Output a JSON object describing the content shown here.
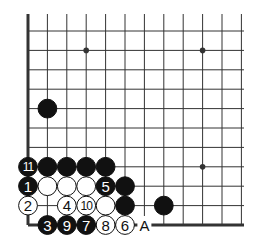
{
  "diagram": {
    "type": "go-board-corner",
    "grid": {
      "cols": 12,
      "rows": 11,
      "origin_x": 28,
      "origin_y": 225,
      "spacing": 19.4,
      "edge_left": true,
      "edge_bottom": true
    },
    "star_points": [
      [
        3,
        9
      ],
      [
        9,
        9
      ],
      [
        9,
        3
      ]
    ],
    "stones": [
      {
        "col": 1,
        "row": 0,
        "color": "black",
        "label": "3"
      },
      {
        "col": 2,
        "row": 0,
        "color": "black",
        "label": "9"
      },
      {
        "col": 3,
        "row": 0,
        "color": "black",
        "label": "7"
      },
      {
        "col": 4,
        "row": 0,
        "color": "white",
        "label": "8"
      },
      {
        "col": 5,
        "row": 0,
        "color": "white",
        "label": "6"
      },
      {
        "col": 0,
        "row": 1,
        "color": "white",
        "label": "2"
      },
      {
        "col": 2,
        "row": 1,
        "color": "white",
        "label": "4"
      },
      {
        "col": 3,
        "row": 1,
        "color": "white",
        "label": "10"
      },
      {
        "col": 4,
        "row": 1,
        "color": "white",
        "label": ""
      },
      {
        "col": 5,
        "row": 1,
        "color": "black",
        "label": ""
      },
      {
        "col": 7,
        "row": 1,
        "color": "black",
        "label": ""
      },
      {
        "col": 0,
        "row": 2,
        "color": "black",
        "label": "1"
      },
      {
        "col": 1,
        "row": 2,
        "color": "white",
        "label": ""
      },
      {
        "col": 2,
        "row": 2,
        "color": "white",
        "label": ""
      },
      {
        "col": 3,
        "row": 2,
        "color": "white",
        "label": ""
      },
      {
        "col": 4,
        "row": 2,
        "color": "black",
        "label": "5"
      },
      {
        "col": 5,
        "row": 2,
        "color": "black",
        "label": ""
      },
      {
        "col": 0,
        "row": 3,
        "color": "black",
        "label": "11"
      },
      {
        "col": 1,
        "row": 3,
        "color": "black",
        "label": ""
      },
      {
        "col": 2,
        "row": 3,
        "color": "black",
        "label": ""
      },
      {
        "col": 3,
        "row": 3,
        "color": "black",
        "label": ""
      },
      {
        "col": 4,
        "row": 3,
        "color": "black",
        "label": ""
      },
      {
        "col": 1,
        "row": 6,
        "color": "black",
        "label": ""
      }
    ],
    "markers": [
      {
        "col": 6,
        "row": 0,
        "label": "A"
      }
    ],
    "colors": {
      "line": "#333333",
      "edge": "#222222",
      "black": "#111111",
      "white": "#ffffff",
      "text_on_black": "#ffffff",
      "text_on_white": "#111111"
    }
  }
}
